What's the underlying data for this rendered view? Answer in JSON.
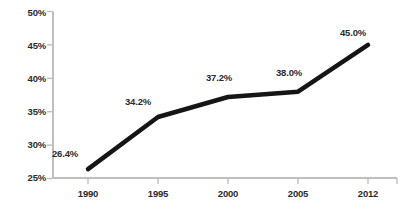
{
  "chart_data": {
    "type": "line",
    "title": "",
    "xlabel": "",
    "ylabel": "",
    "categories": [
      "1990",
      "1995",
      "2000",
      "2005",
      "2012"
    ],
    "values": [
      26.4,
      34.2,
      37.2,
      38.0,
      45.0
    ],
    "point_labels": [
      "26.4%",
      "34.2%",
      "37.2%",
      "38.0%",
      "45.0%"
    ],
    "ylim": [
      25,
      50
    ],
    "ytick_values": [
      25,
      30,
      35,
      40,
      45,
      50
    ],
    "ytick_labels": [
      "25%",
      "30%",
      "35%",
      "40%",
      "45%",
      "50%"
    ],
    "grid": false,
    "legend": false,
    "series_color": "#151515",
    "axis_color": "#bfbfbf",
    "text_color": "#2b2b2b",
    "background": "#ffffff",
    "line_width": 4.5
  }
}
